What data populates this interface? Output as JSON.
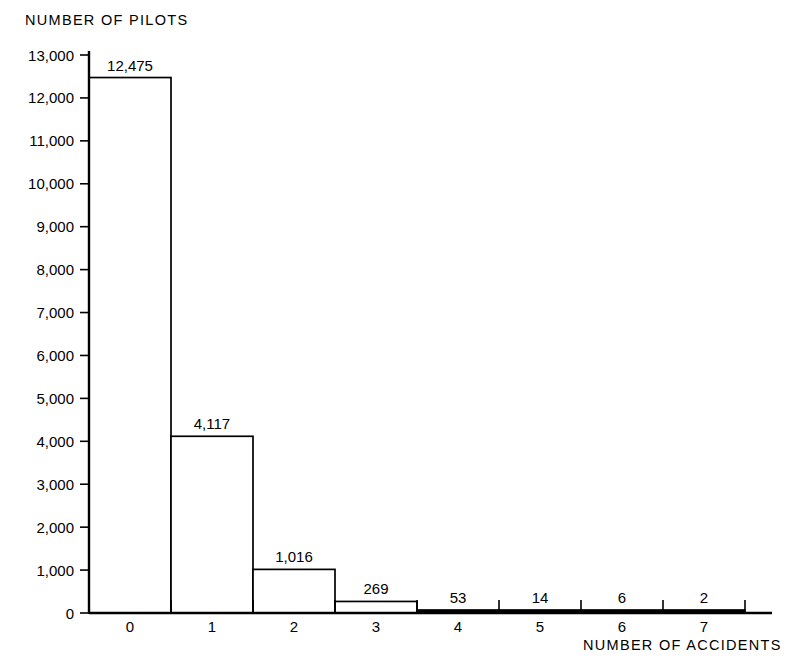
{
  "chart_data": {
    "type": "bar",
    "title": "",
    "categories": [
      "0",
      "1",
      "2",
      "3",
      "4",
      "5",
      "6",
      "7"
    ],
    "values": [
      12475,
      4117,
      1016,
      269,
      53,
      14,
      6,
      2
    ],
    "value_labels": [
      "12,475",
      "4,117",
      "1,016",
      "269",
      "53",
      "14",
      "6",
      "2"
    ],
    "xlabel": "NUMBER OF ACCIDENTS",
    "ylabel": "NUMBER OF PILOTS",
    "ylim": [
      0,
      13000
    ],
    "ytick_values": [
      0,
      1000,
      2000,
      3000,
      4000,
      5000,
      6000,
      7000,
      8000,
      9000,
      10000,
      11000,
      12000,
      13000
    ],
    "ytick_labels": [
      "0",
      "1,000",
      "2,000",
      "3,000",
      "4,000",
      "5,000",
      "6,000",
      "7,000",
      "8,000",
      "9,000",
      "10,000",
      "11,000",
      "12,000",
      "13,000"
    ],
    "grid": false,
    "legend": false,
    "series_color": "#000000",
    "background_color": "#ffffff"
  },
  "labels": {
    "y_axis_title": "NUMBER OF PILOTS",
    "x_axis_title": "NUMBER OF ACCIDENTS"
  },
  "yticks": [
    {
      "label": "13,000",
      "value": 13000
    },
    {
      "label": "12,000",
      "value": 12000
    },
    {
      "label": "11,000",
      "value": 11000
    },
    {
      "label": "10,000",
      "value": 10000
    },
    {
      "label": "9,000",
      "value": 9000
    },
    {
      "label": "8,000",
      "value": 8000
    },
    {
      "label": "7,000",
      "value": 7000
    },
    {
      "label": "6,000",
      "value": 6000
    },
    {
      "label": "5,000",
      "value": 5000
    },
    {
      "label": "4,000",
      "value": 4000
    },
    {
      "label": "3,000",
      "value": 3000
    },
    {
      "label": "2,000",
      "value": 2000
    },
    {
      "label": "1,000",
      "value": 1000
    },
    {
      "label": "0",
      "value": 0
    }
  ],
  "bars": [
    {
      "category": "0",
      "label": "12,475",
      "value": 12475
    },
    {
      "category": "1",
      "label": "4,117",
      "value": 4117
    },
    {
      "category": "2",
      "label": "1,016",
      "value": 1016
    },
    {
      "category": "3",
      "label": "269",
      "value": 269
    },
    {
      "category": "4",
      "label": "53",
      "value": 53
    },
    {
      "category": "5",
      "label": "14",
      "value": 14
    },
    {
      "category": "6",
      "label": "6",
      "value": 6
    },
    {
      "category": "7",
      "label": "2",
      "value": 2
    }
  ]
}
